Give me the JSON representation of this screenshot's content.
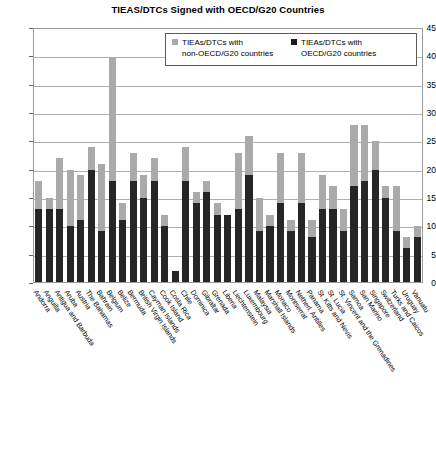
{
  "chart_data": {
    "type": "bar",
    "title": "TIEAS/DTCs Signed with OECD/G20 Countries",
    "xlabel": "",
    "ylabel": "",
    "ylim": [
      0,
      45
    ],
    "ytick_step": 5,
    "yticks": [
      45,
      40,
      35,
      30,
      25,
      20,
      15,
      10,
      5,
      0
    ],
    "grid": true,
    "stacked": true,
    "legend_position": "top-inside",
    "colors": {
      "oecd_g20": "#262626",
      "non_oecd_g20": "#aaaaaa"
    },
    "categories": [
      "Andorra",
      "Anguilla",
      "Antigua and Barbuda",
      "Aruba",
      "Austria",
      "The Bahamas",
      "Bahrain",
      "Belgium",
      "Belize",
      "Bermuda",
      "British Virgin Islands",
      "Cayman Islands",
      "Cook Island",
      "Costa Rica",
      "Chile",
      "Dominica",
      "Gibraltar",
      "Grenada",
      "Liberia",
      "Liechtenstein",
      "Luxembourg",
      "Malaysia",
      "Marshall Islands",
      "Monaco",
      "Montserrat",
      "Netherl. Antilles",
      "Panama",
      "St. Kitts and Nevis",
      "St. Lucia",
      "St. Vincent and the Grenadines",
      "Samoa",
      "San Marino",
      "Singapore",
      "Switzerland",
      "Turks and Caicos",
      "Uruguay",
      "Vanuatu"
    ],
    "series": [
      {
        "name": "TIEAs/DTCs with OECD/G20 countries",
        "key": "oecd_g20",
        "color": "#262626",
        "values": [
          13,
          13,
          13,
          10,
          11,
          20,
          9,
          18,
          11,
          18,
          15,
          18,
          10,
          2,
          18,
          14,
          16,
          12,
          12,
          13,
          19,
          9,
          10,
          14,
          9,
          14,
          8,
          13,
          13,
          9,
          17,
          18,
          20,
          15,
          9,
          6,
          8
        ]
      },
      {
        "name": "TIEAs/DTCs with non-OECD/G20 countries",
        "key": "non_oecd_g20",
        "color": "#aaaaaa",
        "values": [
          5,
          2,
          9,
          10,
          8,
          4,
          12,
          22,
          3,
          5,
          4,
          4,
          2,
          0,
          6,
          2,
          2,
          2,
          0,
          10,
          7,
          6,
          2,
          9,
          2,
          9,
          3,
          6,
          4,
          4,
          11,
          10,
          5,
          2,
          8,
          2,
          2
        ]
      }
    ],
    "totals": [
      18,
      15,
      22,
      20,
      19,
      24,
      21,
      40,
      14,
      23,
      19,
      22,
      12,
      2,
      24,
      16,
      18,
      14,
      12,
      23,
      26,
      15,
      12,
      23,
      11,
      23,
      11,
      19,
      17,
      13,
      28,
      28,
      25,
      17,
      17,
      8,
      10
    ]
  },
  "legend": {
    "entries": [
      {
        "label": "TIEAs/DTCs with\nnon-OECD/G20 countries",
        "swatch": "gray-square-icon"
      },
      {
        "label": "TIEAs/DTCs with\nOECD/G20 countries",
        "swatch": "black-square-icon"
      }
    ]
  }
}
